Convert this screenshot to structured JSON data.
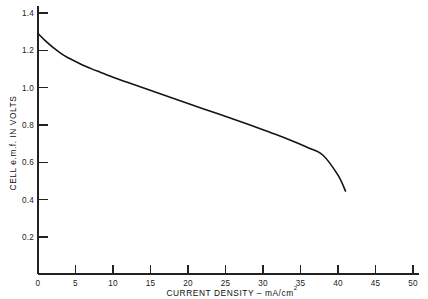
{
  "chart_data": {
    "type": "line",
    "title": "",
    "xlabel": "CURRENT DENSITY – mA/cm",
    "xlabel_superscript": "2",
    "ylabel": "CELL e.m.f. IN VOLTS",
    "xlim": [
      0,
      50
    ],
    "ylim": [
      0,
      1.4
    ],
    "grid": false,
    "legend": null,
    "xticks": [
      0,
      5,
      10,
      15,
      20,
      25,
      30,
      35,
      40,
      45,
      50
    ],
    "xtick_labels": [
      "0",
      "5",
      "10",
      "15",
      "20",
      "25",
      "30",
      "35",
      "40",
      "45",
      "50"
    ],
    "yticks": [
      0.2,
      0.4,
      0.6,
      0.8,
      1.0,
      1.2,
      1.4
    ],
    "ytick_labels": [
      "0.2",
      "0.4",
      "0.6",
      "0.8",
      "1.0",
      "1.2",
      "1.4"
    ],
    "series": [
      {
        "name": "Cell polarization curve",
        "x": [
          0,
          1,
          2,
          3,
          4,
          5,
          6,
          7,
          8,
          10,
          12,
          14,
          16,
          18,
          20,
          22,
          24,
          26,
          28,
          30,
          32,
          34,
          36,
          38,
          40,
          41
        ],
        "y": [
          1.29,
          1.25,
          1.215,
          1.185,
          1.16,
          1.14,
          1.12,
          1.103,
          1.087,
          1.056,
          1.027,
          0.999,
          0.971,
          0.943,
          0.915,
          0.887,
          0.859,
          0.831,
          0.803,
          0.774,
          0.744,
          0.712,
          0.677,
          0.637,
          0.53,
          0.445
        ]
      }
    ]
  },
  "axes_geometry": {
    "x_origin_px": 38,
    "x_end_px": 413,
    "y_origin_px": 274,
    "y_top_px": 13
  }
}
